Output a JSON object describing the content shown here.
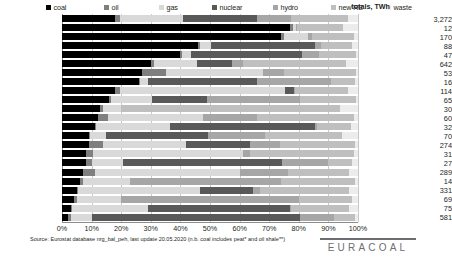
{
  "legend": {
    "items": [
      {
        "label": "coal",
        "color": "#000000",
        "x": 0
      },
      {
        "label": "oil",
        "color": "#7f7f7f",
        "x": 58
      },
      {
        "label": "gas",
        "color": "#d9d9d9",
        "x": 113
      },
      {
        "label": "nuclear",
        "color": "#595959",
        "x": 166
      },
      {
        "label": "hydro",
        "color": "#a6a6a6",
        "x": 227
      },
      {
        "label": "new RE",
        "color": "#bfbfbf",
        "x": 285
      },
      {
        "label": "waste",
        "color": "#ececec",
        "x": 340
      }
    ]
  },
  "totals_header": "totals, TWh",
  "axis": {
    "ticks": [
      "0%",
      "10%",
      "20%",
      "30%",
      "40%",
      "50%",
      "60%",
      "70%",
      "80%",
      "90%",
      "100%"
    ]
  },
  "footer": {
    "source": "Source:  Eurostat database nrg_bal_peh, last update 20.05.2020 (n.b. coal includes peat* and oil shale**)",
    "brand": "EURACOAL"
  },
  "chart_data": {
    "type": "bar",
    "orientation": "horizontal",
    "stacked": true,
    "normalized": true,
    "title": "",
    "xlabel": "",
    "ylabel": "",
    "xlim": [
      0,
      100
    ],
    "grid": true,
    "legend_position": "top",
    "series_names": [
      "coal",
      "oil",
      "gas",
      "nuclear",
      "hydro",
      "new RE",
      "waste"
    ],
    "series_colors": [
      "#000000",
      "#7f7f7f",
      "#d9d9d9",
      "#595959",
      "#a6a6a6",
      "#bfbfbf",
      "#ececec"
    ],
    "value_unit": "percent of gross electricity generation",
    "totals_unit": "TWh",
    "categories": [
      "EU-28",
      "Estonia**",
      "Poland",
      "Czechia",
      "Bulgaria",
      "Germany",
      "Greece",
      "Slovenia",
      "Netherlands",
      "Romania",
      "Denmark",
      "Portugal",
      "Hungary",
      "Finland*",
      "Spain",
      "Ireland*",
      "Slovakia",
      "Italy",
      "Croatia",
      "UK",
      "Austria",
      "Belgium",
      "France"
    ],
    "totals": [
      3272,
      12,
      170,
      88,
      47,
      642,
      53,
      16,
      114,
      65,
      30,
      60,
      32,
      70,
      274,
      31,
      27,
      289,
      14,
      331,
      69,
      75,
      581
    ],
    "rows": [
      {
        "category": "EU-28",
        "total": 3272,
        "values": [
          18.0,
          1.5,
          21.5,
          25.0,
          11.5,
          19.0,
          3.5
        ]
      },
      {
        "category": "Estonia**",
        "total": 12,
        "values": [
          77.0,
          1.0,
          1.0,
          0.0,
          0.5,
          15.5,
          5.0
        ]
      },
      {
        "category": "Poland",
        "total": 170,
        "values": [
          74.0,
          1.0,
          8.0,
          0.0,
          1.5,
          14.0,
          1.5
        ]
      },
      {
        "category": "Czechia",
        "total": 88,
        "values": [
          46.0,
          0.5,
          4.0,
          35.0,
          2.0,
          10.5,
          2.0
        ]
      },
      {
        "category": "Bulgaria",
        "total": 47,
        "values": [
          40.0,
          0.5,
          3.0,
          37.5,
          6.0,
          12.5,
          0.5
        ]
      },
      {
        "category": "Germany",
        "total": 642,
        "values": [
          30.0,
          1.0,
          14.5,
          12.0,
          3.5,
          35.0,
          4.0
        ]
      },
      {
        "category": "Greece",
        "total": 53,
        "values": [
          27.0,
          8.0,
          33.0,
          0.0,
          7.0,
          24.5,
          0.5
        ]
      },
      {
        "category": "Slovenia",
        "total": 16,
        "values": [
          26.0,
          0.5,
          2.5,
          37.0,
          25.0,
          8.0,
          1.0
        ]
      },
      {
        "category": "Netherlands",
        "total": 114,
        "values": [
          18.0,
          1.5,
          56.0,
          3.0,
          0.1,
          18.0,
          3.4
        ]
      },
      {
        "category": "Romania",
        "total": 65,
        "values": [
          16.0,
          0.5,
          14.0,
          18.5,
          31.5,
          19.0,
          0.5
        ]
      },
      {
        "category": "Denmark",
        "total": 30,
        "values": [
          13.0,
          1.0,
          6.0,
          0.0,
          0.1,
          74.0,
          5.9
        ]
      },
      {
        "category": "Portugal",
        "total": 60,
        "values": [
          12.0,
          3.5,
          32.0,
          0.0,
          18.5,
          32.5,
          1.5
        ]
      },
      {
        "category": "Hungary",
        "total": 32,
        "values": [
          11.0,
          0.5,
          25.0,
          49.0,
          0.7,
          11.5,
          2.3
        ]
      },
      {
        "category": "Finland*",
        "total": 70,
        "values": [
          9.0,
          0.5,
          5.5,
          34.5,
          19.0,
          26.0,
          5.5
        ]
      },
      {
        "category": "Spain",
        "total": 274,
        "values": [
          9.0,
          5.0,
          28.0,
          21.5,
          10.0,
          25.5,
          1.0
        ]
      },
      {
        "category": "Ireland*",
        "total": 31,
        "values": [
          8.0,
          2.5,
          50.5,
          0.0,
          2.5,
          35.0,
          1.5
        ]
      },
      {
        "category": "Slovakia",
        "total": 27,
        "values": [
          8.0,
          2.0,
          10.5,
          54.0,
          15.5,
          8.0,
          2.0
        ]
      },
      {
        "category": "Italy",
        "total": 289,
        "values": [
          7.0,
          4.0,
          49.0,
          0.0,
          16.5,
          20.5,
          3.0
        ]
      },
      {
        "category": "Croatia",
        "total": 14,
        "values": [
          6.0,
          1.0,
          16.0,
          0.0,
          51.0,
          25.0,
          1.0
        ]
      },
      {
        "category": "UK",
        "total": 331,
        "values": [
          5.0,
          0.5,
          41.0,
          18.0,
          2.5,
          30.0,
          3.0
        ]
      },
      {
        "category": "Austria",
        "total": 69,
        "values": [
          4.0,
          1.0,
          15.0,
          0.0,
          60.0,
          18.0,
          2.0
        ]
      },
      {
        "category": "Belgium",
        "total": 75,
        "values": [
          3.0,
          0.5,
          25.5,
          48.0,
          0.5,
          19.5,
          3.0
        ]
      },
      {
        "category": "France",
        "total": 581,
        "values": [
          2.0,
          1.0,
          7.0,
          70.5,
          11.5,
          7.0,
          1.0
        ]
      }
    ]
  }
}
